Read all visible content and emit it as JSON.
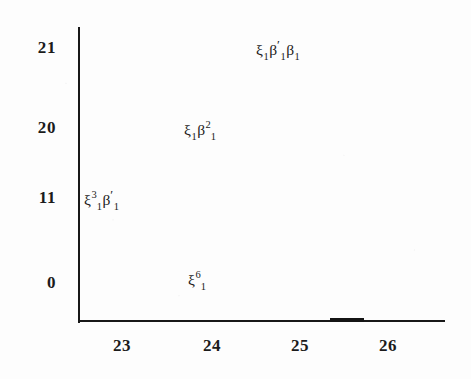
{
  "figure": {
    "background_color": "#fdfdfd",
    "ink_color": "#1b1b1b"
  },
  "chart_data": {
    "type": "scatter",
    "title": "",
    "xlabel": "",
    "ylabel": "",
    "grid": false,
    "legend": null,
    "axes": {
      "x_ticks": [
        "23",
        "24",
        "25",
        "26"
      ],
      "y_ticks": [
        "21",
        "20",
        "11",
        "0"
      ],
      "x_tick_values": [
        23,
        24,
        25,
        26
      ],
      "y_tick_values": [
        21,
        20,
        11,
        0
      ],
      "xlim": [
        22.55,
        26.65
      ],
      "ylim_labels_top_to_bottom": [
        "21",
        "20",
        "11",
        "0"
      ]
    },
    "points": [
      {
        "id": "point-1",
        "x": 24.9,
        "y_tick": "21",
        "label_plain": "xi_1 beta'_1 beta_1",
        "tokens": [
          {
            "base": "ξ",
            "sup": "",
            "sub": "1",
            "prime": false
          },
          {
            "base": "β",
            "sup": "",
            "sub": "1",
            "prime": true
          },
          {
            "base": "β",
            "sup": "",
            "sub": "1",
            "prime": false
          }
        ]
      },
      {
        "id": "point-2",
        "x": 24.0,
        "y_tick": "20",
        "label_plain": "xi_1 beta^2_1",
        "tokens": [
          {
            "base": "ξ",
            "sup": "",
            "sub": "1",
            "prime": false
          },
          {
            "base": "β",
            "sup": "2",
            "sub": "1",
            "prime": false
          }
        ]
      },
      {
        "id": "point-3",
        "x": 22.8,
        "y_tick": "11",
        "label_plain": "xi^3_1 beta'_1",
        "tokens": [
          {
            "base": "ξ",
            "sup": "3",
            "sub": "1",
            "prime": false
          },
          {
            "base": "β",
            "sup": "",
            "sub": "1",
            "prime": true
          }
        ]
      },
      {
        "id": "point-4",
        "x": 24.05,
        "y_tick": "0",
        "label_plain": "xi^6_1",
        "tokens": [
          {
            "base": "ξ",
            "sup": "6",
            "sub": "1",
            "prime": false
          }
        ]
      }
    ]
  },
  "ticks": {
    "y": [
      {
        "text": "21",
        "top": 48
      },
      {
        "text": "20",
        "top": 128
      },
      {
        "text": "11",
        "top": 198
      },
      {
        "text": "0",
        "top": 283
      }
    ],
    "x": [
      {
        "text": "23",
        "left": 122
      },
      {
        "text": "24",
        "left": 212
      },
      {
        "text": "25",
        "left": 300
      },
      {
        "text": "26",
        "left": 388
      }
    ]
  },
  "annotations": [
    {
      "left": 256,
      "top": 50
    },
    {
      "left": 184,
      "top": 130
    },
    {
      "left": 84,
      "top": 200
    },
    {
      "left": 188,
      "top": 280
    }
  ]
}
